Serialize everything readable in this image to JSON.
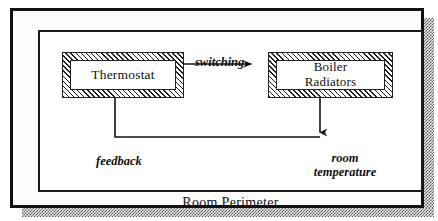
{
  "diagram": {
    "title": "Room Perimeter",
    "type": "control-feedback-block-diagram",
    "outer_label": "Room Perimeter",
    "nodes": [
      {
        "id": "thermostat",
        "label": "Thermostat",
        "style": "hatched-box"
      },
      {
        "id": "boiler",
        "label": "Boiler\nRadiators",
        "label_line1": "Boiler",
        "label_line2": "Radiators",
        "style": "hatched-box"
      }
    ],
    "edges": [
      {
        "id": "switching",
        "label": "switching",
        "from": "thermostat",
        "to": "boiler",
        "direction": "right"
      },
      {
        "id": "room-temperature",
        "label_line1": "room",
        "label_line2": "temperature",
        "from": "boiler",
        "to": "room",
        "direction": "down"
      },
      {
        "id": "feedback",
        "label": "feedback",
        "from": "room",
        "to": "thermostat",
        "direction": "up"
      }
    ],
    "colors": {
      "line": "#111111",
      "hatch": "#1c1c1c",
      "background": "#ffffff",
      "shadow": "#585858"
    }
  }
}
